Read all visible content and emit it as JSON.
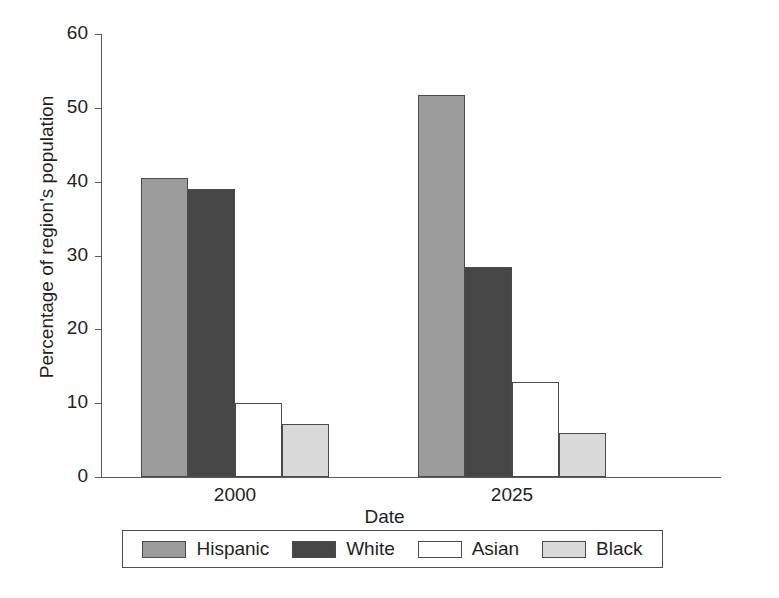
{
  "chart_data": {
    "type": "bar",
    "title": "",
    "xlabel": "Date",
    "ylabel": "Percentage of region's population",
    "categories": [
      "2000",
      "2025"
    ],
    "series": [
      {
        "name": "Hispanic",
        "values": [
          40.5,
          51.7
        ],
        "color": "#9b9b9b"
      },
      {
        "name": "White",
        "values": [
          39.0,
          28.4
        ],
        "color": "#464646"
      },
      {
        "name": "Asian",
        "values": [
          10.0,
          12.9
        ],
        "color": "#ffffff"
      },
      {
        "name": "Black",
        "values": [
          7.2,
          5.9
        ],
        "color": "#d9d9d9"
      }
    ],
    "ylim": [
      0,
      60
    ],
    "yticks": [
      "0",
      "10",
      "20",
      "30",
      "40",
      "50",
      "60"
    ],
    "grid": false,
    "legend_position": "bottom"
  },
  "axes": {
    "y_title": "Percentage of region's population",
    "x_title": "Date",
    "y_tick_labels": [
      "60",
      "50",
      "40",
      "30",
      "20",
      "10",
      "0"
    ],
    "x_tick_labels": [
      "2000",
      "2025"
    ]
  },
  "legend": {
    "items": [
      {
        "label": "Hispanic",
        "color": "#9b9b9b"
      },
      {
        "label": "White",
        "color": "#464646"
      },
      {
        "label": "Asian",
        "color": "#ffffff"
      },
      {
        "label": "Black",
        "color": "#d9d9d9"
      }
    ]
  }
}
